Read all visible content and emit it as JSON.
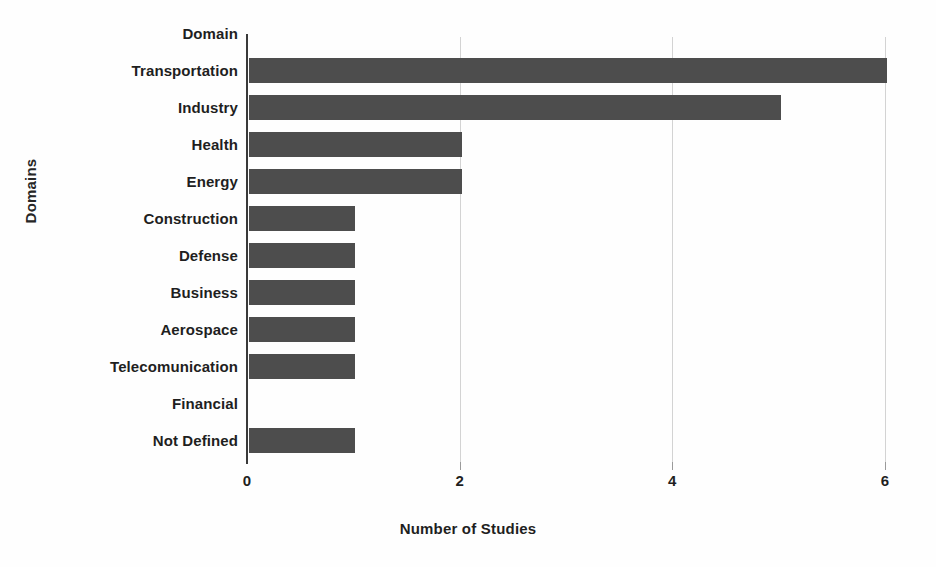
{
  "chart_data": {
    "type": "bar",
    "orientation": "horizontal",
    "title": "",
    "xlabel": "Number of Studies",
    "ylabel": "Domains",
    "categories": [
      "Domain",
      "Transportation",
      "Industry",
      "Health",
      "Energy",
      "Construction",
      "Defense",
      "Business",
      "Aerospace",
      "Telecomunication",
      "Financial",
      "Not Defined"
    ],
    "values": [
      0,
      6,
      5,
      2,
      2,
      1,
      1,
      1,
      1,
      1,
      0,
      1
    ],
    "xlim": [
      0,
      6.0
    ],
    "xticks": [
      0,
      2,
      4,
      6
    ],
    "xtick_labels": [
      "0",
      "2",
      "4",
      "6"
    ],
    "grid": "vertical",
    "legend": "none",
    "bar_color": "#4d4d4d",
    "gridline_color": "#d3d3d3",
    "axis_color": "#3a3a3a",
    "background_color": "#fefefe"
  }
}
